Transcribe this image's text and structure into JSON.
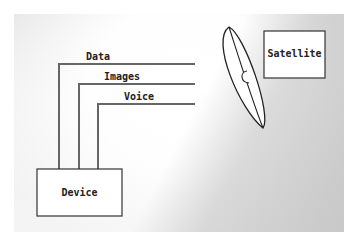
{
  "diagram": {
    "nodes": {
      "device": {
        "label": "Device"
      },
      "satellite": {
        "label": "Satellite"
      }
    },
    "links": [
      {
        "label": "Data"
      },
      {
        "label": "Images"
      },
      {
        "label": "Voice"
      }
    ],
    "dish": {
      "icon": "satellite-dish-icon"
    }
  }
}
